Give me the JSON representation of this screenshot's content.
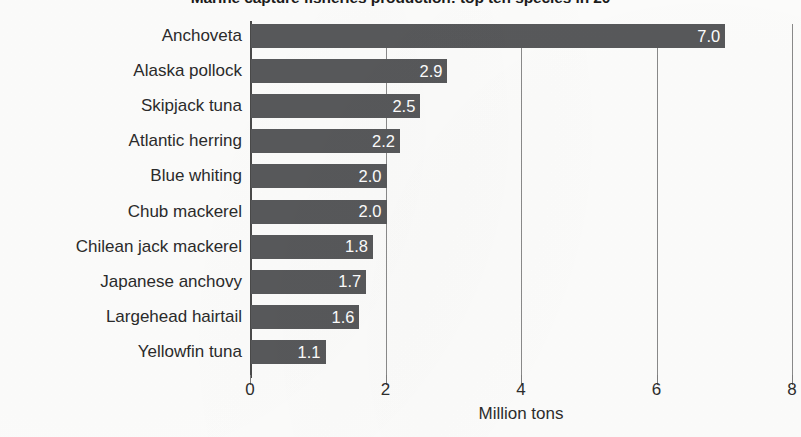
{
  "chart_data": {
    "type": "bar",
    "orientation": "horizontal",
    "title": "Marine capture fisheries production: top ten species in 20",
    "xlabel": "Million tons",
    "ylabel": "",
    "xlim": [
      0,
      8
    ],
    "xticks": [
      0,
      2,
      4,
      6,
      8
    ],
    "xtick_labels": [
      "0",
      "2",
      "4",
      "6",
      "8"
    ],
    "grid": true,
    "grid_axis": "x",
    "legend": false,
    "value_labels_inside_bars": true,
    "bar_color": "#58595b",
    "value_label_color": "#ffffff",
    "categories": [
      "Anchoveta",
      "Alaska pollock",
      "Skipjack tuna",
      "Atlantic herring",
      "Blue whiting",
      "Chub mackerel",
      "Chilean jack mackerel",
      "Japanese anchovy",
      "Largehead hairtail",
      "Yellowfin tuna"
    ],
    "values": [
      7.0,
      2.9,
      2.5,
      2.2,
      2.0,
      2.0,
      1.8,
      1.7,
      1.6,
      1.1
    ],
    "value_labels": [
      "7.0",
      "2.9",
      "2.5",
      "2.2",
      "2.0",
      "2.0",
      "1.8",
      "1.7",
      "1.6",
      "1.1"
    ]
  }
}
